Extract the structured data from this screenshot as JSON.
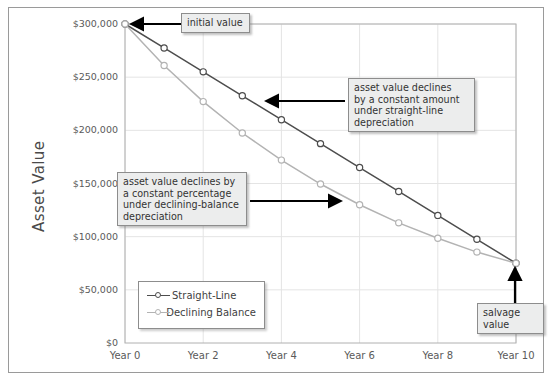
{
  "chart_data": {
    "type": "line",
    "title": "",
    "xlabel": "",
    "ylabel": "Asset Value",
    "x": [
      0,
      1,
      2,
      3,
      4,
      5,
      6,
      7,
      8,
      9,
      10
    ],
    "xticklabels": [
      "Year 0",
      "Year 2",
      "Year 4",
      "Year 6",
      "Year 8",
      "Year 10"
    ],
    "xtickvalues": [
      0,
      2,
      4,
      6,
      8,
      10
    ],
    "yticklabels": [
      "$0",
      "$50,000",
      "$100,000",
      "$150,000",
      "$200,000",
      "$250,000",
      "$300,000"
    ],
    "ytickvalues": [
      0,
      50000,
      100000,
      150000,
      200000,
      250000,
      300000
    ],
    "ylim": [
      0,
      300000
    ],
    "xlim": [
      0,
      10
    ],
    "grid": true,
    "legend_position": "lower-left-inside",
    "series": [
      {
        "name": "Straight-Line",
        "color": "#4d4d4d",
        "marker": "open-circle",
        "values": [
          300000,
          277500,
          255000,
          232500,
          210000,
          187500,
          165000,
          142500,
          120000,
          97500,
          75000
        ]
      },
      {
        "name": "Declining Balance",
        "color": "#b3b3b3",
        "marker": "open-circle",
        "values": [
          300000,
          261000,
          227000,
          197500,
          172000,
          149500,
          130000,
          113000,
          98500,
          85500,
          75000
        ]
      }
    ],
    "annotations": [
      {
        "name": "initial-value",
        "text": "initial value",
        "points_to": {
          "x": 0,
          "y": 300000
        }
      },
      {
        "name": "straight-line-note",
        "text": "asset value declines\nby a constant amount\nunder straight-line\ndepreciation",
        "points_to": {
          "x": 3,
          "y": 232500
        }
      },
      {
        "name": "declining-balance-note",
        "text": "asset value declines by\na constant percentage\nunder declining-balance\ndepreciation",
        "points_to": {
          "x": 5,
          "y": 149500
        }
      },
      {
        "name": "salvage-value",
        "text": "salvage value",
        "points_to": {
          "x": 10,
          "y": 75000
        }
      }
    ]
  },
  "colors": {
    "frame": "#9a9a9a",
    "grid": "#e4e4e4",
    "plot_border": "#b0b0b0",
    "text": "#5a5a5a",
    "callout_bg": "#eceded",
    "callout_border": "#8d8d8d",
    "arrow": "#000000",
    "series_straight_line": "#4d4d4d",
    "series_declining_balance": "#b3b3b3"
  }
}
